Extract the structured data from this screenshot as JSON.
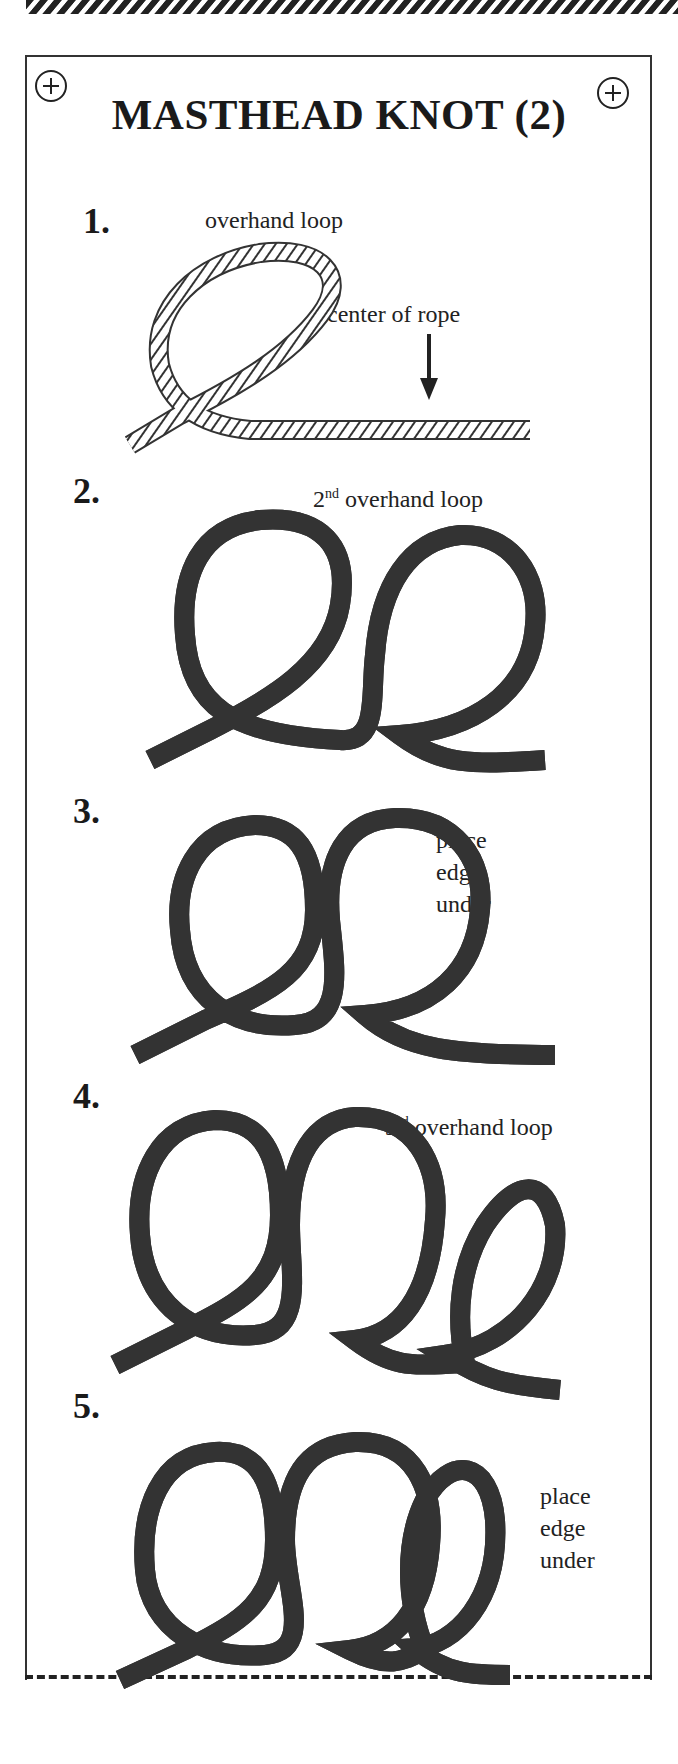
{
  "header": {
    "title": "MASTHEAD  KNOT (2)",
    "hole_icons": [
      "punch-hole-left",
      "punch-hole-right"
    ]
  },
  "steps": [
    {
      "number": "1.",
      "labels": [
        "overhand loop",
        "center of rope"
      ],
      "figure": "single-loop-with-arrow"
    },
    {
      "number": "2.",
      "label_prefix": "2",
      "label_sup": "nd",
      "label_suffix": " overhand loop",
      "figure": "two-loops"
    },
    {
      "number": "3.",
      "labels": [
        "place",
        "edge",
        "under"
      ],
      "figure": "two-loops-overlapped"
    },
    {
      "number": "4.",
      "label_prefix": "3",
      "label_sup": "rd",
      "label_suffix": " overhand loop",
      "figure": "three-loops"
    },
    {
      "number": "5.",
      "labels": [
        "place",
        "edge",
        "under"
      ],
      "figure": "three-loops-overlapped"
    }
  ],
  "colors": {
    "ink": "#222222",
    "paper": "#ffffff"
  }
}
